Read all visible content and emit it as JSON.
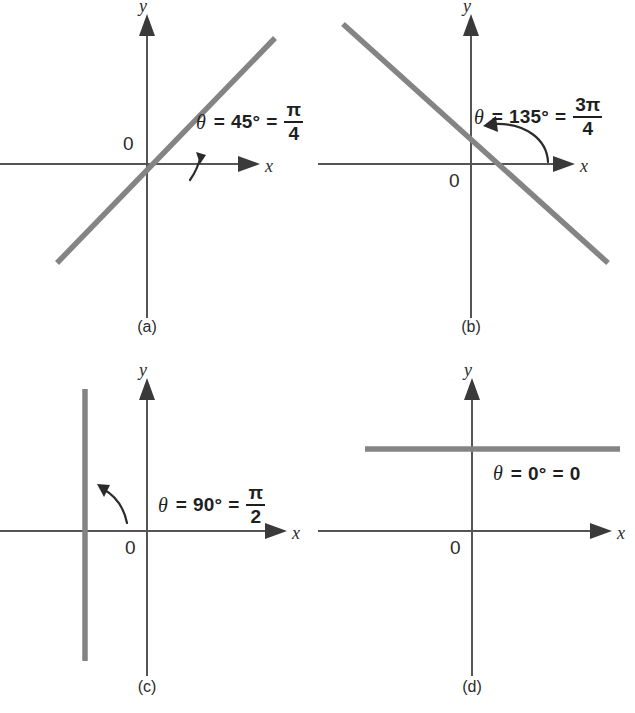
{
  "figure": {
    "type": "math-diagram-set",
    "background": "#ffffff",
    "line_color": "#848484",
    "axis_color": "#555555",
    "text_color": "#1f1f1f"
  },
  "axis_labels": {
    "x": "x",
    "y": "y",
    "origin": "0"
  },
  "panels": [
    {
      "caption": "(a)",
      "angle_degrees": "45",
      "degree_symbol": "°",
      "label_theta": "θ",
      "label_equals": "=",
      "radian_numerator": "π",
      "radian_denominator": "4",
      "radian_has_fraction": true,
      "radian_plain": "",
      "slope": 1,
      "line_kind": "through-origin"
    },
    {
      "caption": "(b)",
      "angle_degrees": "135",
      "degree_symbol": "°",
      "label_theta": "θ",
      "label_equals": "=",
      "radian_numerator": "3π",
      "radian_denominator": "4",
      "radian_has_fraction": true,
      "radian_plain": "",
      "slope": -1,
      "line_kind": "through-origin"
    },
    {
      "caption": "(c)",
      "angle_degrees": "90",
      "degree_symbol": "°",
      "label_theta": "θ",
      "label_equals": "=",
      "radian_numerator": "π",
      "radian_denominator": "2",
      "radian_has_fraction": true,
      "radian_plain": "",
      "slope": null,
      "line_kind": "vertical-offset-left"
    },
    {
      "caption": "(d)",
      "angle_degrees": "0",
      "degree_symbol": "°",
      "label_theta": "θ",
      "label_equals": "=",
      "radian_numerator": "",
      "radian_denominator": "",
      "radian_has_fraction": false,
      "radian_plain": "0",
      "slope": 0,
      "line_kind": "horizontal-offset-up"
    }
  ]
}
